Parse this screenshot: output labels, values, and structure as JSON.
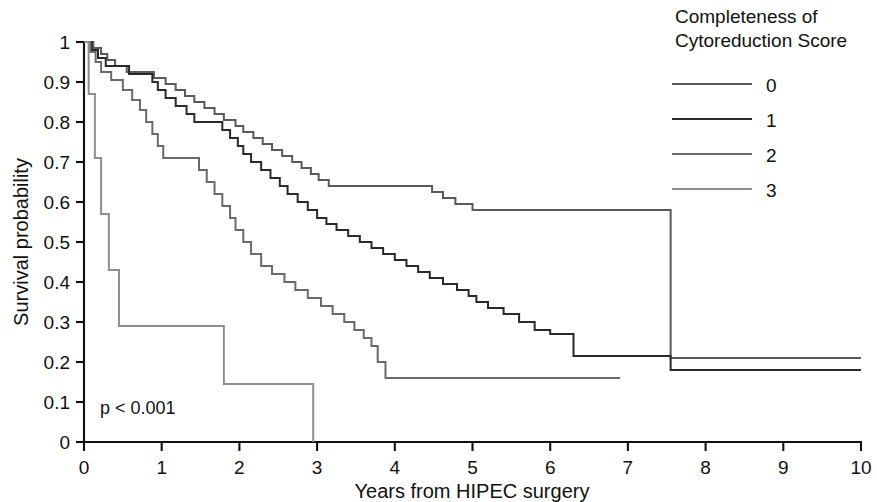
{
  "chart_data": {
    "type": "line",
    "subtype": "kaplan-meier-step",
    "title": "",
    "xlabel": "Years from HIPEC surgery",
    "ylabel": "Survival probability",
    "xlim": [
      0,
      10
    ],
    "ylim": [
      0,
      1
    ],
    "xticks": [
      0,
      1,
      2,
      3,
      4,
      5,
      6,
      7,
      8,
      9,
      10
    ],
    "xtick_labels": [
      "0",
      "1",
      "2",
      "3",
      "4",
      "5",
      "6",
      "7",
      "8",
      "9",
      "10"
    ],
    "yticks": [
      0,
      0.1,
      0.2,
      0.3,
      0.4,
      0.5,
      0.6,
      0.7,
      0.8,
      0.9,
      1
    ],
    "ytick_labels": [
      "0",
      "0.1",
      "0.2",
      "0.3",
      "0.4",
      "0.5",
      "0.6",
      "0.7",
      "0.8",
      "0.9",
      "1"
    ],
    "grid": false,
    "legend_position": "top-right",
    "legend_title": "Completeness of Cytoreduction Score",
    "annotations": [
      {
        "text": "p < 0.001",
        "x": 0.25,
        "y": 0.085
      }
    ],
    "series": [
      {
        "name": "0",
        "label": "0",
        "color": "#5a5a5a",
        "points": [
          [
            0.0,
            1.0
          ],
          [
            0.12,
            0.985
          ],
          [
            0.22,
            0.97
          ],
          [
            0.3,
            0.955
          ],
          [
            0.4,
            0.94
          ],
          [
            0.55,
            0.925
          ],
          [
            0.72,
            0.925
          ],
          [
            0.9,
            0.91
          ],
          [
            1.05,
            0.895
          ],
          [
            1.18,
            0.88
          ],
          [
            1.3,
            0.865
          ],
          [
            1.42,
            0.85
          ],
          [
            1.55,
            0.835
          ],
          [
            1.68,
            0.82
          ],
          [
            1.8,
            0.805
          ],
          [
            1.95,
            0.79
          ],
          [
            2.05,
            0.775
          ],
          [
            2.18,
            0.76
          ],
          [
            2.3,
            0.745
          ],
          [
            2.42,
            0.73
          ],
          [
            2.55,
            0.715
          ],
          [
            2.68,
            0.7
          ],
          [
            2.8,
            0.685
          ],
          [
            2.92,
            0.67
          ],
          [
            3.02,
            0.655
          ],
          [
            3.15,
            0.64
          ],
          [
            3.3,
            0.64
          ],
          [
            4.35,
            0.64
          ],
          [
            4.48,
            0.625
          ],
          [
            4.62,
            0.61
          ],
          [
            4.78,
            0.595
          ],
          [
            5.0,
            0.58
          ],
          [
            5.15,
            0.58
          ],
          [
            7.45,
            0.58
          ],
          [
            7.55,
            0.21
          ],
          [
            10.0,
            0.21
          ]
        ],
        "final_value": 0.21,
        "last_time": 10.0
      },
      {
        "name": "1",
        "label": "1",
        "color": "#2a2a2a",
        "points": [
          [
            0.0,
            1.0
          ],
          [
            0.1,
            0.98
          ],
          [
            0.18,
            0.96
          ],
          [
            0.28,
            0.94
          ],
          [
            0.42,
            0.94
          ],
          [
            0.58,
            0.92
          ],
          [
            0.75,
            0.92
          ],
          [
            0.88,
            0.9
          ],
          [
            0.95,
            0.88
          ],
          [
            1.05,
            0.86
          ],
          [
            1.18,
            0.84
          ],
          [
            1.32,
            0.82
          ],
          [
            1.42,
            0.8
          ],
          [
            1.58,
            0.8
          ],
          [
            1.78,
            0.78
          ],
          [
            1.88,
            0.76
          ],
          [
            1.98,
            0.74
          ],
          [
            2.05,
            0.72
          ],
          [
            2.15,
            0.7
          ],
          [
            2.28,
            0.68
          ],
          [
            2.4,
            0.66
          ],
          [
            2.52,
            0.64
          ],
          [
            2.62,
            0.62
          ],
          [
            2.75,
            0.6
          ],
          [
            2.88,
            0.58
          ],
          [
            3.0,
            0.56
          ],
          [
            3.12,
            0.545
          ],
          [
            3.25,
            0.53
          ],
          [
            3.4,
            0.515
          ],
          [
            3.55,
            0.5
          ],
          [
            3.7,
            0.485
          ],
          [
            3.85,
            0.47
          ],
          [
            4.0,
            0.455
          ],
          [
            4.15,
            0.44
          ],
          [
            4.3,
            0.425
          ],
          [
            4.45,
            0.41
          ],
          [
            4.62,
            0.395
          ],
          [
            4.8,
            0.38
          ],
          [
            4.95,
            0.365
          ],
          [
            5.05,
            0.35
          ],
          [
            5.2,
            0.335
          ],
          [
            5.4,
            0.32
          ],
          [
            5.6,
            0.3
          ],
          [
            5.8,
            0.28
          ],
          [
            6.0,
            0.27
          ],
          [
            6.2,
            0.27
          ],
          [
            6.3,
            0.215
          ],
          [
            7.45,
            0.215
          ],
          [
            7.55,
            0.18
          ],
          [
            10.0,
            0.18
          ]
        ],
        "final_value": 0.18,
        "last_time": 10.0
      },
      {
        "name": "2",
        "label": "2",
        "color": "#6a6a6a",
        "points": [
          [
            0.0,
            1.0
          ],
          [
            0.08,
            0.975
          ],
          [
            0.15,
            0.95
          ],
          [
            0.22,
            0.925
          ],
          [
            0.35,
            0.905
          ],
          [
            0.5,
            0.88
          ],
          [
            0.62,
            0.855
          ],
          [
            0.72,
            0.83
          ],
          [
            0.8,
            0.8
          ],
          [
            0.88,
            0.77
          ],
          [
            0.95,
            0.74
          ],
          [
            1.02,
            0.71
          ],
          [
            1.12,
            0.71
          ],
          [
            1.35,
            0.71
          ],
          [
            1.48,
            0.68
          ],
          [
            1.58,
            0.65
          ],
          [
            1.68,
            0.62
          ],
          [
            1.78,
            0.59
          ],
          [
            1.88,
            0.56
          ],
          [
            1.95,
            0.53
          ],
          [
            2.05,
            0.5
          ],
          [
            2.15,
            0.47
          ],
          [
            2.28,
            0.44
          ],
          [
            2.42,
            0.42
          ],
          [
            2.58,
            0.4
          ],
          [
            2.72,
            0.38
          ],
          [
            2.88,
            0.36
          ],
          [
            3.05,
            0.34
          ],
          [
            3.2,
            0.32
          ],
          [
            3.35,
            0.3
          ],
          [
            3.48,
            0.28
          ],
          [
            3.6,
            0.26
          ],
          [
            3.7,
            0.24
          ],
          [
            3.78,
            0.2
          ],
          [
            3.88,
            0.16
          ],
          [
            6.9,
            0.16
          ]
        ],
        "final_value": 0.16,
        "last_time": 6.9
      },
      {
        "name": "3",
        "label": "3",
        "color": "#8e8e8e",
        "points": [
          [
            0.0,
            1.0
          ],
          [
            0.06,
            0.87
          ],
          [
            0.14,
            0.71
          ],
          [
            0.22,
            0.57
          ],
          [
            0.32,
            0.43
          ],
          [
            0.45,
            0.29
          ],
          [
            1.75,
            0.29
          ],
          [
            1.8,
            0.145
          ],
          [
            2.92,
            0.145
          ],
          [
            2.95,
            0.0
          ]
        ],
        "final_value": 0.0,
        "last_time": 2.95
      }
    ]
  },
  "legend": {
    "title_line1": "Completeness of",
    "title_line2": "Cytoreduction Score",
    "items": [
      {
        "label": "0",
        "color": "#5a5a5a"
      },
      {
        "label": "1",
        "color": "#2a2a2a"
      },
      {
        "label": "2",
        "color": "#6a6a6a"
      },
      {
        "label": "3",
        "color": "#8e8e8e"
      }
    ]
  },
  "axes": {
    "y_title": "Survival probability",
    "x_title": "Years from HIPEC surgery"
  },
  "stats": {
    "p_value_text": "p < 0.001"
  }
}
